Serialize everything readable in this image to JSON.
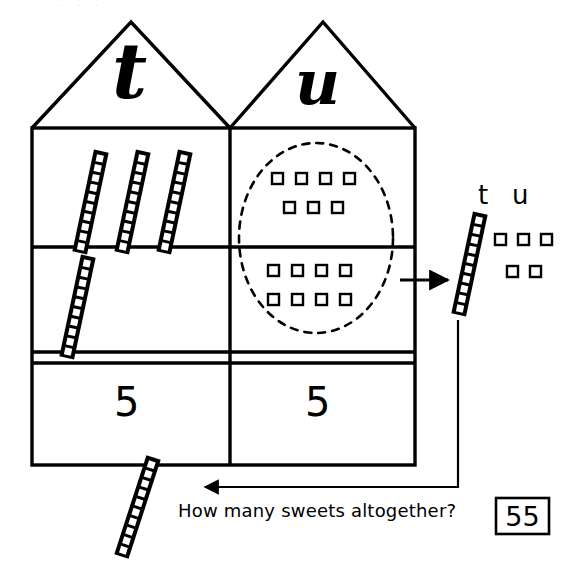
{
  "worksheet": {
    "title": "How many sweets altogether?",
    "top_cut_text": "· · ·",
    "ink_color": "#000000",
    "paper_color": "#ffffff"
  },
  "house": {
    "roofs": [
      {
        "id": "tens-roof",
        "letter": "t",
        "meaning": "tens"
      },
      {
        "id": "units-roof",
        "letter": "u",
        "meaning": "units"
      }
    ],
    "rows": [
      {
        "id": "row-1",
        "tens": {
          "rods": 3,
          "beads_per_rod": 10,
          "value": 30
        },
        "units": {
          "squares": 7,
          "rows": [
            4,
            3
          ],
          "value": 7
        }
      },
      {
        "id": "row-2",
        "tens": {
          "rods": 1,
          "beads_per_rod": 10,
          "value": 10
        },
        "units": {
          "squares": 8,
          "rows": [
            4,
            4
          ],
          "value": 8
        }
      }
    ],
    "answer_row": {
      "tens_digit": "5",
      "units_digit": "5"
    }
  },
  "exchange": {
    "ring_label": "dashed-ring-around-units",
    "units_collected": 15,
    "result_tens_rods": 1,
    "result_units_squares": 5,
    "result_units_rows": [
      3,
      2
    ],
    "column_labels": {
      "tens": "t",
      "units": "u"
    }
  },
  "question": {
    "text": "How many sweets altogether?",
    "answer": "55"
  }
}
